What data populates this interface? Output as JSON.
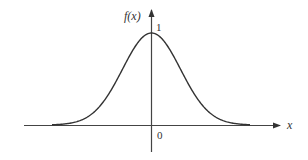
{
  "chart_data": {
    "type": "line",
    "title": "",
    "xlabel": "x",
    "ylabel": "f(x)",
    "series": [
      {
        "name": "f(x)",
        "shape": "gaussian bell curve",
        "peak_x": 0,
        "peak_y": 1
      }
    ],
    "annotations": [
      {
        "text": "1",
        "position": "peak value on y-axis"
      },
      {
        "text": "0",
        "position": "origin on x-axis"
      }
    ],
    "grid": false,
    "legend": null
  },
  "labels": {
    "y_axis": "f(x)",
    "x_axis": "x",
    "peak": "1",
    "origin": "0"
  }
}
